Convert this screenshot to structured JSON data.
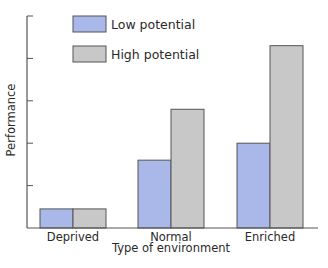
{
  "chart_data": {
    "type": "bar",
    "title": "",
    "xlabel": "Type of environment",
    "ylabel": "Performance",
    "categories": [
      "Deprived",
      "Normal",
      "Enriched"
    ],
    "series": [
      {
        "name": "Low potential",
        "color": "#a9b8e8",
        "values": [
          0.9,
          3.2,
          4.0
        ]
      },
      {
        "name": "High potential",
        "color": "#c8c8c8",
        "values": [
          0.9,
          5.6,
          8.6
        ]
      }
    ],
    "ylim": [
      0,
      10
    ],
    "yticks": [
      2,
      4,
      6,
      8,
      10
    ],
    "ytick_labels_shown": false,
    "grid": false,
    "legend_position": "upper left"
  }
}
